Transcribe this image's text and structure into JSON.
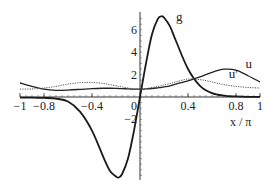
{
  "chart_data": {
    "type": "line",
    "title": "",
    "xlabel": "x / π",
    "ylabel": "",
    "xlim": [
      -1,
      1
    ],
    "ylim": [
      -7.2,
      7.4
    ],
    "grid": false,
    "legend": "inline curve labels",
    "x_ticks": [
      -1,
      -0.8,
      -0.4,
      0,
      0.4,
      0.8,
      1
    ],
    "x_tick_labels": [
      "−1",
      "−0.8",
      "−0.4",
      "0",
      "0.4",
      "0.8",
      "1"
    ],
    "y_ticks": [
      -2,
      2,
      4,
      6
    ],
    "y_tick_labels": [
      "−2",
      "2",
      "4",
      "6"
    ],
    "x": [
      -1,
      -0.9,
      -0.8,
      -0.7,
      -0.6,
      -0.5,
      -0.4,
      -0.3,
      -0.25,
      -0.2,
      -0.18,
      -0.15,
      -0.1,
      -0.05,
      0,
      0.05,
      0.1,
      0.15,
      0.18,
      0.2,
      0.25,
      0.3,
      0.4,
      0.5,
      0.6,
      0.7,
      0.8,
      0.9,
      1
    ],
    "series": [
      {
        "name": "g",
        "style": "solid-thick",
        "values": [
          -0.05,
          -0.05,
          -0.08,
          -0.15,
          -0.4,
          -1.3,
          -3.0,
          -5.5,
          -6.6,
          -7.1,
          -7.2,
          -6.9,
          -5.5,
          -3.0,
          0.0,
          3.0,
          5.6,
          7.0,
          7.2,
          7.1,
          6.3,
          5.0,
          2.5,
          1.0,
          0.35,
          0.12,
          0.05,
          0.02,
          0.02
        ]
      },
      {
        "name": "u",
        "style": "solid",
        "values": [
          1.25,
          0.95,
          0.7,
          0.6,
          0.62,
          0.68,
          0.75,
          0.78,
          0.78,
          0.77,
          0.76,
          0.75,
          0.72,
          0.7,
          0.7,
          0.72,
          0.76,
          0.82,
          0.86,
          0.9,
          1.0,
          1.15,
          1.45,
          1.8,
          2.2,
          2.48,
          2.4,
          1.9,
          1.35
        ]
      },
      {
        "name": "u'",
        "style": "dotted",
        "values": [
          0.7,
          0.72,
          0.8,
          0.95,
          1.15,
          1.28,
          1.3,
          1.2,
          1.1,
          1.0,
          0.95,
          0.9,
          0.8,
          0.72,
          0.7,
          0.75,
          0.85,
          0.95,
          1.02,
          1.08,
          1.2,
          1.35,
          1.6,
          1.55,
          1.35,
          1.1,
          0.95,
          0.85,
          0.8
        ]
      }
    ],
    "annotations": [
      {
        "text": "g",
        "x": 0.3,
        "y": 6.8
      },
      {
        "text": "u",
        "x": 0.88,
        "y": 2.6
      },
      {
        "text": "u'",
        "x": 0.74,
        "y": 1.7
      }
    ]
  }
}
